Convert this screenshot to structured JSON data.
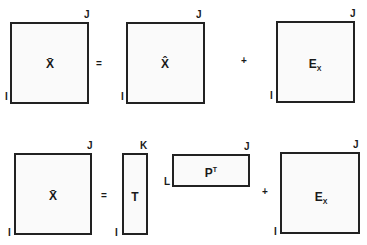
{
  "row1": {
    "matrix_left": {
      "label": "X̄",
      "row_dim": "I",
      "col_dim": "J"
    },
    "op1": "=",
    "matrix_mid": {
      "label": "X̂",
      "row_dim": "I",
      "col_dim": "J"
    },
    "op2": "+",
    "matrix_right": {
      "label_main": "E",
      "label_sub": "X",
      "row_dim": "I",
      "col_dim": "J"
    }
  },
  "row2": {
    "matrix_left": {
      "label": "X̄",
      "row_dim": "I",
      "col_dim": "J"
    },
    "op1": "=",
    "matrix_t": {
      "label": "T",
      "row_dim": "I",
      "col_dim": "K"
    },
    "matrix_p": {
      "label_main": "P",
      "label_sup": "T",
      "row_dim": "L",
      "col_dim": "J"
    },
    "op2": "+",
    "matrix_right": {
      "label_main": "E",
      "label_sub": "X",
      "row_dim": "I",
      "col_dim": "J"
    }
  }
}
